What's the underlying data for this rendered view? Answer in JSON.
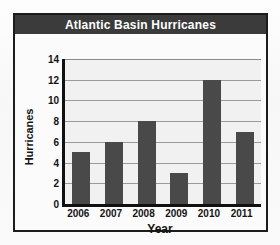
{
  "chart_data": {
    "type": "bar",
    "title": "Atlantic Basin Hurricanes",
    "xlabel": "Year",
    "ylabel": "Hurricanes",
    "categories": [
      "2006",
      "2007",
      "2008",
      "2009",
      "2010",
      "2011"
    ],
    "values": [
      5,
      6,
      8,
      3,
      12,
      7
    ],
    "ylim": [
      0,
      14
    ],
    "ytick_labels": [
      "14",
      "12",
      "10",
      "8",
      "6",
      "4",
      "2",
      "0"
    ],
    "ytick_values": [
      14,
      12,
      10,
      8,
      6,
      4,
      2,
      0
    ],
    "grid": true,
    "legend": null,
    "colors": {
      "bar": "#494949",
      "title_banner": "#3b3b3b",
      "title_text": "#ffffff",
      "plot_background": "#f1f1f1",
      "gridline": "#9b9b9b",
      "axis": "#111111",
      "frame": "#1c1c1c",
      "text": "#141414"
    }
  }
}
